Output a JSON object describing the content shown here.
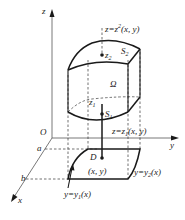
{
  "figure": {
    "type": "3d-region-diagram",
    "axes": {
      "z_label": "z",
      "y_label": "y",
      "x_label": "x",
      "origin_label": "O"
    },
    "x_ticks": [
      "a",
      "b"
    ],
    "surfaces": {
      "upper": {
        "label": "S",
        "sub": "2",
        "equation": "z=z",
        "eq_sup": "2",
        "eq_args": "(x, y)"
      },
      "lower": {
        "label": "S",
        "sub": "1",
        "equation": "z=z",
        "eq_sub": "1",
        "eq_args": "(x, y)"
      }
    },
    "region_label": "Ω",
    "points": {
      "z2": {
        "label": "z",
        "sub": "2"
      },
      "z1": {
        "label": "z",
        "sub": "1"
      }
    },
    "domain": {
      "label": "D",
      "point": "(x, y)",
      "left_curve": {
        "eq": "y=y",
        "sub": "1",
        "args": "(x)"
      },
      "right_curve": {
        "eq": "y=y",
        "sub": "2",
        "args": "(x)"
      }
    },
    "colors": {
      "ink": "#1a1a1a",
      "axis": "#555555",
      "background": "#ffffff"
    }
  }
}
